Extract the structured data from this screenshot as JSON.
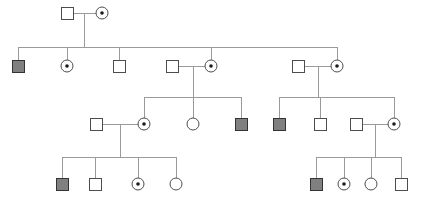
{
  "diagram": {
    "type": "pedigree-chart",
    "title": "",
    "width": 421,
    "height": 203,
    "background_color": "#ffffff",
    "line_color": "#9a9a9a",
    "symbol_stroke_color": "#4d4d4d",
    "symbol_stroke_color_dark": "#333333",
    "affected_fill_color": "#808080",
    "unaffected_fill_color": "#ffffff",
    "carrier_dot_color": "#1a1a1a",
    "symbol_size": 12,
    "circle_radius": 6,
    "carrier_dot_radius": 1.8,
    "legend_note": "",
    "generations": [
      {
        "id": "generation-1",
        "label": "I",
        "members": [
          {
            "id": "I-1",
            "shape": "square",
            "sex": "male",
            "status": "unaffected",
            "carrier": false,
            "x": 67,
            "y": 13
          },
          {
            "id": "I-2",
            "shape": "circle",
            "sex": "female",
            "status": "unaffected",
            "carrier": true,
            "x": 102,
            "y": 13
          }
        ]
      },
      {
        "id": "generation-2",
        "label": "II",
        "members": [
          {
            "id": "II-1",
            "shape": "square",
            "sex": "male",
            "status": "affected",
            "carrier": false,
            "x": 18,
            "y": 66
          },
          {
            "id": "II-2",
            "shape": "circle",
            "sex": "female",
            "status": "unaffected",
            "carrier": true,
            "x": 67,
            "y": 66
          },
          {
            "id": "II-3",
            "shape": "square",
            "sex": "male",
            "status": "unaffected",
            "carrier": false,
            "x": 119,
            "y": 66
          },
          {
            "id": "II-4",
            "shape": "square",
            "sex": "male",
            "status": "unaffected",
            "carrier": false,
            "x": 172,
            "y": 66
          },
          {
            "id": "II-5",
            "shape": "circle",
            "sex": "female",
            "status": "unaffected",
            "carrier": true,
            "x": 211,
            "y": 66
          },
          {
            "id": "II-6",
            "shape": "square",
            "sex": "male",
            "status": "unaffected",
            "carrier": false,
            "x": 298,
            "y": 66
          },
          {
            "id": "II-7",
            "shape": "circle",
            "sex": "female",
            "status": "unaffected",
            "carrier": true,
            "x": 337,
            "y": 66
          }
        ]
      },
      {
        "id": "generation-3",
        "label": "III",
        "members": [
          {
            "id": "III-1",
            "shape": "square",
            "sex": "male",
            "status": "unaffected",
            "carrier": false,
            "x": 96,
            "y": 124
          },
          {
            "id": "III-2",
            "shape": "circle",
            "sex": "female",
            "status": "unaffected",
            "carrier": true,
            "x": 144,
            "y": 124
          },
          {
            "id": "III-3",
            "shape": "circle",
            "sex": "female",
            "status": "unaffected",
            "carrier": false,
            "x": 193,
            "y": 124
          },
          {
            "id": "III-4",
            "shape": "square",
            "sex": "male",
            "status": "affected",
            "carrier": false,
            "x": 241,
            "y": 124
          },
          {
            "id": "III-5",
            "shape": "square",
            "sex": "male",
            "status": "affected",
            "carrier": false,
            "x": 279,
            "y": 124
          },
          {
            "id": "III-6",
            "shape": "square",
            "sex": "male",
            "status": "unaffected",
            "carrier": false,
            "x": 320,
            "y": 124
          },
          {
            "id": "III-7",
            "shape": "square",
            "sex": "male",
            "status": "unaffected",
            "carrier": false,
            "x": 356,
            "y": 124
          },
          {
            "id": "III-8",
            "shape": "circle",
            "sex": "female",
            "status": "unaffected",
            "carrier": true,
            "x": 394,
            "y": 124
          }
        ]
      },
      {
        "id": "generation-4",
        "label": "IV",
        "members": [
          {
            "id": "IV-1",
            "shape": "square",
            "sex": "male",
            "status": "affected",
            "carrier": false,
            "x": 62,
            "y": 184
          },
          {
            "id": "IV-2",
            "shape": "square",
            "sex": "male",
            "status": "unaffected",
            "carrier": false,
            "x": 95,
            "y": 184
          },
          {
            "id": "IV-3",
            "shape": "circle",
            "sex": "female",
            "status": "unaffected",
            "carrier": true,
            "x": 138,
            "y": 184
          },
          {
            "id": "IV-4",
            "shape": "circle",
            "sex": "female",
            "status": "unaffected",
            "carrier": false,
            "x": 176,
            "y": 184
          },
          {
            "id": "IV-5",
            "shape": "square",
            "sex": "male",
            "status": "affected",
            "carrier": false,
            "x": 316,
            "y": 184
          },
          {
            "id": "IV-6",
            "shape": "circle",
            "sex": "female",
            "status": "unaffected",
            "carrier": true,
            "x": 344,
            "y": 184
          },
          {
            "id": "IV-7",
            "shape": "circle",
            "sex": "female",
            "status": "unaffected",
            "carrier": false,
            "x": 371,
            "y": 184
          },
          {
            "id": "IV-8",
            "shape": "square",
            "sex": "male",
            "status": "unaffected",
            "carrier": false,
            "x": 401,
            "y": 184
          }
        ]
      }
    ],
    "mating_lines": [
      {
        "id": "mating-I-1-I-2",
        "x1": 73,
        "y1": 13,
        "x2": 96,
        "y2": 13
      },
      {
        "id": "mating-II-4-II-5",
        "x1": 178,
        "y1": 66,
        "x2": 205,
        "y2": 66
      },
      {
        "id": "mating-II-6-II-7",
        "x1": 304,
        "y1": 66,
        "x2": 331,
        "y2": 66
      },
      {
        "id": "mating-III-1-III-2",
        "x1": 102,
        "y1": 124,
        "x2": 138,
        "y2": 124
      },
      {
        "id": "mating-III-7-III-8",
        "x1": 362,
        "y1": 124,
        "x2": 388,
        "y2": 124
      }
    ],
    "descent_lines": [
      {
        "id": "descent-I-to-II",
        "x1": 84,
        "y1": 13,
        "x2": 84,
        "y2": 47
      },
      {
        "id": "descent-II-mid-to-III",
        "x1": 193,
        "y1": 66,
        "x2": 193,
        "y2": 97
      },
      {
        "id": "descent-II-right-to-III",
        "x1": 318,
        "y1": 66,
        "x2": 318,
        "y2": 97
      },
      {
        "id": "descent-III-left-to-IV",
        "x1": 120,
        "y1": 124,
        "x2": 120,
        "y2": 157
      },
      {
        "id": "descent-III-right-to-IV",
        "x1": 375,
        "y1": 124,
        "x2": 375,
        "y2": 157
      }
    ],
    "sibship_lines": [
      {
        "id": "sibship-generation-2",
        "y": 47,
        "x1": 18,
        "x2": 337
      },
      {
        "id": "sibship-generation-3-left",
        "y": 97,
        "x1": 144,
        "x2": 241
      },
      {
        "id": "sibship-generation-3-right",
        "y": 97,
        "x1": 279,
        "x2": 394
      },
      {
        "id": "sibship-generation-4-left",
        "y": 157,
        "x1": 62,
        "x2": 176
      },
      {
        "id": "sibship-generation-4-right",
        "y": 157,
        "x1": 316,
        "x2": 401
      }
    ],
    "drop_lines": [
      {
        "id": "drop-II-1",
        "x": 18,
        "y1": 47,
        "y2": 60
      },
      {
        "id": "drop-II-2",
        "x": 67,
        "y1": 47,
        "y2": 60
      },
      {
        "id": "drop-II-3",
        "x": 119,
        "y1": 47,
        "y2": 60
      },
      {
        "id": "drop-II-5",
        "x": 211,
        "y1": 47,
        "y2": 60
      },
      {
        "id": "drop-II-7",
        "x": 337,
        "y1": 47,
        "y2": 60
      },
      {
        "id": "drop-III-2",
        "x": 144,
        "y1": 97,
        "y2": 118
      },
      {
        "id": "drop-III-3",
        "x": 193,
        "y1": 97,
        "y2": 118
      },
      {
        "id": "drop-III-4",
        "x": 241,
        "y1": 97,
        "y2": 118
      },
      {
        "id": "drop-III-5",
        "x": 279,
        "y1": 97,
        "y2": 118
      },
      {
        "id": "drop-III-6",
        "x": 320,
        "y1": 97,
        "y2": 118
      },
      {
        "id": "drop-III-8",
        "x": 394,
        "y1": 97,
        "y2": 118
      },
      {
        "id": "drop-IV-1",
        "x": 62,
        "y1": 157,
        "y2": 178
      },
      {
        "id": "drop-IV-2",
        "x": 95,
        "y1": 157,
        "y2": 178
      },
      {
        "id": "drop-IV-3",
        "x": 138,
        "y1": 157,
        "y2": 178
      },
      {
        "id": "drop-IV-4",
        "x": 176,
        "y1": 157,
        "y2": 178
      },
      {
        "id": "drop-IV-5",
        "x": 316,
        "y1": 157,
        "y2": 178
      },
      {
        "id": "drop-IV-6",
        "x": 344,
        "y1": 157,
        "y2": 178
      },
      {
        "id": "drop-IV-7",
        "x": 371,
        "y1": 157,
        "y2": 178
      },
      {
        "id": "drop-IV-8",
        "x": 401,
        "y1": 157,
        "y2": 178
      }
    ]
  }
}
